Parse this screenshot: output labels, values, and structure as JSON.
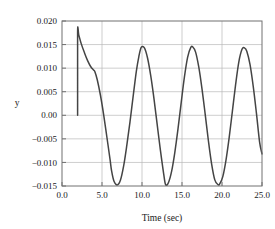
{
  "chart_data": {
    "type": "line",
    "title": "",
    "subtitle": "",
    "xlabel": "Time (sec)",
    "ylabel": "y",
    "xlim": [
      0.0,
      25.0
    ],
    "ylim": [
      -0.015,
      0.02
    ],
    "grid": true,
    "legend": null,
    "legend_position": "none",
    "xticks": [
      0.0,
      5.0,
      10.0,
      15.0,
      20.0,
      25.0
    ],
    "xticklabels": [
      "0.0",
      "5.0",
      "10.0",
      "15.0",
      "20.0",
      "25.0"
    ],
    "yticks": [
      0.02,
      0.015,
      0.01,
      0.005,
      0.0,
      -0.005,
      -0.01,
      -0.015
    ],
    "yticklabels": [
      "0.020",
      "0.015",
      "0.010",
      "0.005",
      "0.00",
      "−0.005",
      "−0.010",
      "−0.015"
    ],
    "line_color": "#444444",
    "grid_color": "#b8b8b8",
    "frame_color": "#707070",
    "background_color": "#ffffff",
    "series": [
      {
        "name": "y",
        "x": [
          1.95,
          1.95,
          2.1,
          2.4,
          2.8,
          3.2,
          3.6,
          3.95,
          4.1,
          4.4,
          4.8,
          5.2,
          5.6,
          6.0,
          6.2,
          6.5,
          6.9,
          7.3,
          7.7,
          8.1,
          8.5,
          8.9,
          9.3,
          9.6,
          9.9,
          10.3,
          10.7,
          11.1,
          11.5,
          11.9,
          12.3,
          12.7,
          12.95,
          13.3,
          13.7,
          14.1,
          14.5,
          14.9,
          15.3,
          15.7,
          16.1,
          16.35,
          16.7,
          17.1,
          17.5,
          17.9,
          18.3,
          18.7,
          19.1,
          19.5,
          19.7,
          20.1,
          20.5,
          20.9,
          21.3,
          21.7,
          22.1,
          22.5,
          22.8,
          23.1,
          23.5,
          23.9,
          24.3,
          24.7,
          25.0
        ],
        "y": [
          0.0,
          0.01755,
          0.017,
          0.0152,
          0.0133,
          0.0116,
          0.0103,
          0.0096,
          0.0093,
          0.0076,
          0.0043,
          0.0002,
          -0.0045,
          -0.0093,
          -0.0118,
          -0.014,
          -0.01478,
          -0.0138,
          -0.0108,
          -0.0064,
          -0.0014,
          0.0041,
          0.0094,
          0.0124,
          0.0144,
          0.0143,
          0.0121,
          0.0083,
          0.0035,
          -0.002,
          -0.0074,
          -0.0123,
          -0.0147,
          -0.0143,
          -0.0119,
          -0.0079,
          -0.0029,
          0.0027,
          0.0081,
          0.0123,
          0.0144,
          0.01448,
          0.0134,
          0.0102,
          0.0056,
          0.0002,
          -0.0054,
          -0.0103,
          -0.0137,
          -0.0147,
          -0.0146,
          -0.013,
          -0.0095,
          -0.0047,
          0.0009,
          0.0065,
          0.0113,
          0.014,
          0.0143,
          0.0136,
          0.0108,
          0.0062,
          0.0005,
          -0.0057,
          -0.0082
        ]
      }
    ],
    "annotations": []
  }
}
